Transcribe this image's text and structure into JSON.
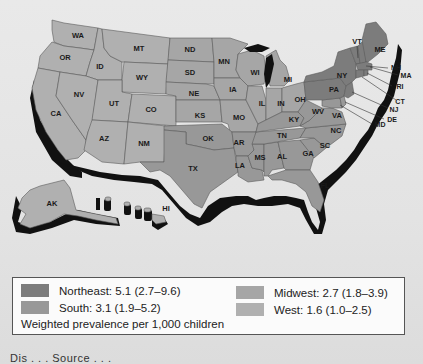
{
  "map": {
    "type": "choropleth",
    "subject": "Weighted prevalence per 1,000 children by US Census region",
    "states": {
      "WA": "West",
      "OR": "West",
      "CA": "West",
      "ID": "West",
      "NV": "West",
      "MT": "West",
      "WY": "West",
      "UT": "West",
      "CO": "West",
      "AZ": "West",
      "NM": "West",
      "AK": "West",
      "HI": "West",
      "ND": "Midwest",
      "SD": "Midwest",
      "NE": "Midwest",
      "KS": "Midwest",
      "MN": "Midwest",
      "IA": "Midwest",
      "MO": "Midwest",
      "WI": "Midwest",
      "IL": "Midwest",
      "MI": "Midwest",
      "IN": "Midwest",
      "OH": "Midwest",
      "TX": "South",
      "OK": "South",
      "AR": "South",
      "LA": "South",
      "MS": "South",
      "AL": "South",
      "TN": "South",
      "KY": "South",
      "GA": "South",
      "FL": "South",
      "SC": "South",
      "NC": "South",
      "VA": "South",
      "WV": "South",
      "MD": "South",
      "DE": "South",
      "PA": "Northeast",
      "NY": "Northeast",
      "NJ": "Northeast",
      "CT": "Northeast",
      "RI": "Northeast",
      "MA": "Northeast",
      "VT": "Northeast",
      "NH": "Northeast",
      "ME": "Northeast"
    },
    "labels": [
      "WA",
      "OR",
      "CA",
      "ID",
      "NV",
      "MT",
      "WY",
      "UT",
      "CO",
      "AZ",
      "NM",
      "ND",
      "SD",
      "NE",
      "KS",
      "OK",
      "TX",
      "MN",
      "IA",
      "MO",
      "AR",
      "LA",
      "WI",
      "IL",
      "MI",
      "IN",
      "OH",
      "KY",
      "TN",
      "MS",
      "AL",
      "GA",
      "FL",
      "SC",
      "NC",
      "VA",
      "WV",
      "PA",
      "NY",
      "VT",
      "ME",
      "NH",
      "MA",
      "RI",
      "CT",
      "NJ",
      "DE",
      "MD",
      "AK",
      "HI"
    ]
  },
  "legend": {
    "items": [
      {
        "region": "Northeast",
        "label": "Northeast: 5.1 (2.7–9.6)",
        "value": 5.1,
        "ci_low": 2.7,
        "ci_high": 9.6,
        "color": "#7c7c7c"
      },
      {
        "region": "South",
        "label": "South: 3.1 (1.9–5.2)",
        "value": 3.1,
        "ci_low": 1.9,
        "ci_high": 5.2,
        "color": "#989898"
      },
      {
        "region": "Midwest",
        "label": "Midwest: 2.7 (1.8–3.9)",
        "value": 2.7,
        "ci_low": 1.8,
        "ci_high": 3.9,
        "color": "#a6a6a6"
      },
      {
        "region": "West",
        "label": "West: 1.6 (1.0–2.5)",
        "value": 1.6,
        "ci_low": 1.0,
        "ci_high": 2.5,
        "color": "#b0b0b0"
      }
    ],
    "note": "Weighted prevalence per 1,000 children"
  },
  "caption": "Dis . . . Source . . ."
}
